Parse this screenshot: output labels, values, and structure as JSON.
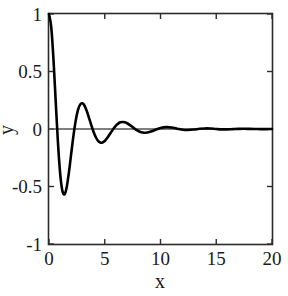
{
  "figure": {
    "background_color": "#ffffff",
    "frame_color": "#2b2b2b",
    "curve_color": "#000000",
    "zeroline_color": "#555555"
  },
  "axis_titles": {
    "x": "x",
    "y": "y"
  },
  "chart_data": {
    "type": "line",
    "title": "",
    "subtitle": "",
    "xlabel": "x",
    "ylabel": "y",
    "xlim": [
      0,
      20
    ],
    "ylim": [
      -1,
      1
    ],
    "xticks": [
      0,
      5,
      10,
      15,
      20
    ],
    "yticks": [
      -1,
      -0.5,
      0,
      0.5,
      1
    ],
    "xticklabels": [
      "0",
      "5",
      "10",
      "15",
      "20"
    ],
    "yticklabels": [
      "-1",
      "-0.5",
      "0",
      "0.5",
      "1"
    ],
    "grid": false,
    "legend": null,
    "annotations": [],
    "series": [
      {
        "name": "damped oscillation",
        "color": "#000000",
        "linewidth": 2.6,
        "description": "exponentially damped cosine, y = exp(-0.3x) * cos(2x)",
        "x": [
          0,
          0.2,
          0.4,
          0.6,
          0.8,
          1,
          1.2,
          1.4,
          1.6,
          1.8,
          2,
          2.2,
          2.4,
          2.6,
          2.8,
          3,
          3.2,
          3.4,
          3.6,
          3.8,
          4,
          4.2,
          4.4,
          4.6,
          4.8,
          5,
          5.2,
          5.4,
          5.6,
          5.8,
          6,
          6.2,
          6.4,
          6.6,
          6.8,
          7,
          7.2,
          7.4,
          7.6,
          7.8,
          8,
          8.2,
          8.4,
          8.6,
          8.8,
          9,
          9.2,
          9.4,
          9.6,
          9.8,
          10,
          10.5,
          11,
          11.5,
          12,
          12.5,
          13,
          13.5,
          14,
          14.5,
          15,
          15.5,
          16,
          16.5,
          17,
          17.5,
          18,
          18.5,
          19,
          19.5,
          20
        ],
        "y": [
          1,
          0.887,
          0.608,
          0.243,
          -0.113,
          -0.385,
          -0.537,
          -0.567,
          -0.499,
          -0.367,
          -0.208,
          -0.053,
          0.075,
          0.166,
          0.214,
          0.223,
          0.2,
          0.153,
          0.093,
          0.031,
          -0.026,
          -0.072,
          -0.103,
          -0.118,
          -0.117,
          -0.104,
          -0.081,
          -0.053,
          -0.023,
          0.005,
          0.029,
          0.047,
          0.058,
          0.061,
          0.058,
          0.05,
          0.038,
          0.024,
          0.009,
          -0.005,
          -0.017,
          -0.026,
          -0.031,
          -0.033,
          -0.031,
          -0.027,
          -0.02,
          -0.013,
          -0.005,
          0.002,
          0.009,
          0.016,
          0.013,
          0.003,
          -0.007,
          -0.009,
          -0.005,
          0.002,
          0.005,
          0.004,
          0,
          -0.003,
          -0.003,
          -0.001,
          0.001,
          0.002,
          0.001,
          0,
          -0.001,
          -0.001,
          0
        ]
      },
      {
        "name": "zero reference line",
        "color": "#555555",
        "linewidth": 1,
        "x": [
          0,
          20
        ],
        "y": [
          0,
          0
        ]
      }
    ]
  }
}
